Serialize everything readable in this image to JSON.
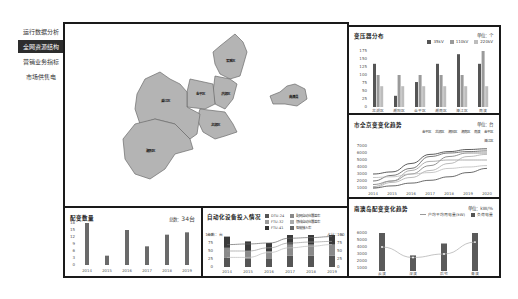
{
  "sidebar": {
    "items": [
      {
        "label": "运行数据分析",
        "active": false
      },
      {
        "label": "全网资源结构",
        "active": true
      },
      {
        "label": "营销业务指标",
        "active": false
      },
      {
        "label": "市场供售电",
        "active": false
      }
    ]
  },
  "map": {
    "districts": [
      "梁溪区",
      "洪湖区",
      "金平区",
      "龙湖区",
      "濠江区",
      "潮阳区",
      "南澳县"
    ]
  },
  "transformer": {
    "title": "变压器分布",
    "unit": "单位：个",
    "legend": [
      "35kV",
      "110kV",
      "220kV"
    ]
  },
  "electricity": {
    "title": "市全京变变化趋势",
    "unit": "单位：台",
    "legend": [
      "金平区",
      "龙湖区",
      "潮阳区",
      "潮南区",
      "南澳",
      "金平区",
      "濠江区"
    ]
  },
  "distribution_count": {
    "title": "配变数量",
    "total_label": "总数：",
    "total_value": "34台"
  },
  "automation": {
    "title": "自动化设备投入情况",
    "legend": [
      "DTU-24",
      "配网自动化覆盖率",
      "FTU-32",
      "馈线自动化覆盖率",
      "FTU-41",
      "智能接入率"
    ],
    "left_axis_label": "台数：台",
    "right_axis_label": "占比：%"
  },
  "nanao": {
    "title": "南澳岛配变变化趋势",
    "unit": "单位：kW/%",
    "legend": [
      "户均平均用电量(kW)",
      "负荷电量"
    ]
  },
  "chart_data": [
    {
      "type": "bar",
      "title": "变压器分布",
      "categories": [
        "龙湖区",
        "潮阳区",
        "金平区",
        "潮南区",
        "濠江区",
        "南澳"
      ],
      "series": [
        {
          "name": "35kV",
          "values": [
            135,
            35,
            78,
            135,
            165,
            135
          ]
        },
        {
          "name": "110kV",
          "values": [
            100,
            100,
            100,
            100,
            100,
            175
          ]
        },
        {
          "name": "220kV",
          "values": [
            65,
            65,
            65,
            65,
            65,
            65
          ]
        }
      ],
      "ylim": [
        0,
        175
      ],
      "yticks": [
        0,
        25,
        50,
        75,
        100,
        125,
        150,
        175
      ],
      "colors": [
        "#555555",
        "#9a9a9a",
        "#bdbdbd"
      ]
    },
    {
      "type": "line",
      "title": "市全京变变化趋势",
      "x": [
        "2014",
        "2015",
        "2016",
        "2017",
        "2018",
        "2019",
        "2020"
      ],
      "yticks": [
        1000,
        2000,
        3000,
        4000,
        5000,
        6000,
        7000
      ],
      "ylim": [
        1000,
        7000
      ],
      "series": [
        {
          "name": "s1",
          "values": [
            3000,
            3300,
            4500,
            5800,
            6200,
            6500,
            6600
          ]
        },
        {
          "name": "s2",
          "values": [
            2000,
            2800,
            3800,
            5500,
            6000,
            6200,
            6300
          ]
        },
        {
          "name": "s3",
          "values": [
            1500,
            2000,
            3000,
            4200,
            5500,
            6000,
            6000
          ]
        },
        {
          "name": "s4",
          "values": [
            1200,
            2000,
            3500,
            4800,
            5000,
            5000,
            5000
          ]
        },
        {
          "name": "s5",
          "values": [
            1000,
            1800,
            2500,
            3500,
            4500,
            5500,
            5800
          ]
        },
        {
          "name": "s6",
          "values": [
            2500,
            2600,
            3000,
            3200,
            3800,
            4000,
            4200
          ]
        },
        {
          "name": "s7",
          "values": [
            1000,
            1300,
            1700,
            2100,
            2600,
            3200,
            3800
          ]
        }
      ]
    },
    {
      "type": "bar",
      "title": "配变数量",
      "categories": [
        "2014",
        "2015",
        "2016",
        "2017",
        "2018",
        "2019"
      ],
      "values": [
        18,
        4,
        15,
        8,
        13,
        14
      ],
      "yticks": [
        0,
        3,
        6,
        9,
        12,
        15,
        18
      ],
      "ylim": [
        0,
        18
      ]
    },
    {
      "type": "bar",
      "title": "自动化设备投入情况",
      "categories": [
        "2014",
        "2015",
        "2016",
        "2017",
        "2018",
        "2019"
      ],
      "series": [
        {
          "name": "DTU-24",
          "values": [
            30,
            25,
            25,
            35,
            35,
            35
          ]
        },
        {
          "name": "FTU-32",
          "values": [
            30,
            25,
            25,
            35,
            35,
            35
          ]
        },
        {
          "name": "FTU-41",
          "values": [
            35,
            30,
            25,
            30,
            30,
            30
          ]
        }
      ],
      "line_series": [
        {
          "name": "配网自动化覆盖率",
          "values": [
            70,
            72,
            75,
            90,
            92,
            95
          ]
        },
        {
          "name": "馈线自动化覆盖率",
          "values": [
            50,
            50,
            60,
            75,
            78,
            80
          ]
        },
        {
          "name": "智能接入率",
          "values": [
            30,
            30,
            45,
            60,
            65,
            70
          ]
        }
      ],
      "ylim": [
        0,
        100
      ],
      "yticks": [
        0,
        25,
        50,
        75,
        100
      ]
    },
    {
      "type": "bar",
      "title": "南澳岛配变变化趋势",
      "categories": [
        "云澳",
        "深澳",
        "后宅",
        "青澳"
      ],
      "values": [
        6000,
        2800,
        4500,
        6000
      ],
      "line_series": [
        {
          "name": "户均平均用电量(kW)",
          "values": [
            4000,
            2500,
            3000,
            4700
          ]
        }
      ],
      "yticks": [
        1000,
        2000,
        3000,
        4000,
        5000,
        6000
      ],
      "ylim": [
        1000,
        6000
      ]
    }
  ]
}
